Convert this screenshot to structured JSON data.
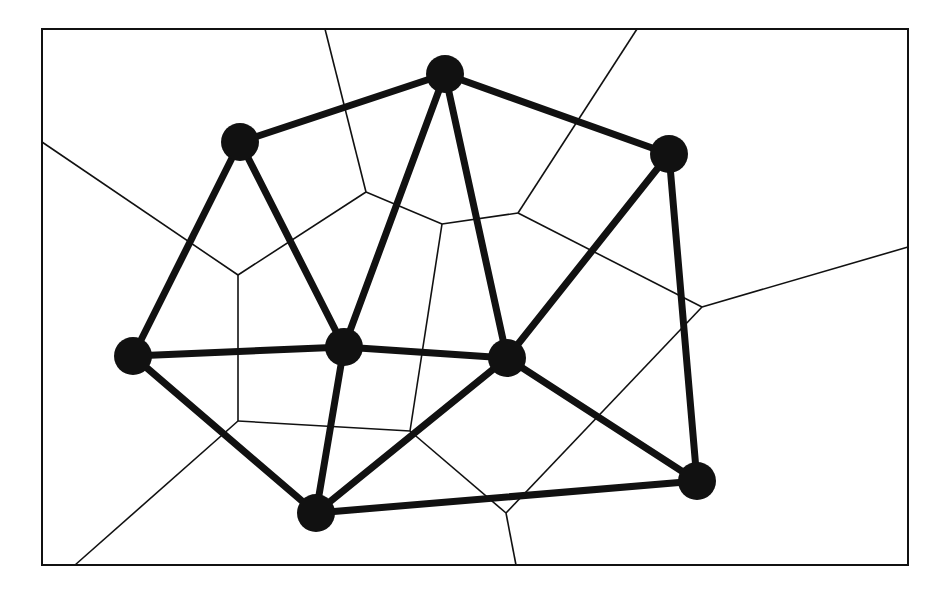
{
  "colors": {
    "background": "#ffffff",
    "ink": "#111111"
  },
  "frame": {
    "x": 42,
    "y": 29,
    "width": 866,
    "height": 536
  },
  "nodes": [
    {
      "id": "A",
      "x": 240,
      "y": 142
    },
    {
      "id": "B",
      "x": 445,
      "y": 74
    },
    {
      "id": "C",
      "x": 669,
      "y": 154
    },
    {
      "id": "D",
      "x": 133,
      "y": 356
    },
    {
      "id": "E",
      "x": 344,
      "y": 347
    },
    {
      "id": "G",
      "x": 507,
      "y": 358
    },
    {
      "id": "F",
      "x": 316,
      "y": 513
    },
    {
      "id": "H",
      "x": 697,
      "y": 481
    }
  ],
  "delaunay_edges": [
    [
      "A",
      "B"
    ],
    [
      "B",
      "C"
    ],
    [
      "A",
      "D"
    ],
    [
      "A",
      "E"
    ],
    [
      "B",
      "E"
    ],
    [
      "B",
      "G"
    ],
    [
      "C",
      "G"
    ],
    [
      "C",
      "H"
    ],
    [
      "D",
      "E"
    ],
    [
      "E",
      "G"
    ],
    [
      "D",
      "F"
    ],
    [
      "E",
      "F"
    ],
    [
      "G",
      "F"
    ],
    [
      "G",
      "H"
    ],
    [
      "F",
      "H"
    ]
  ],
  "voronoi_edges": [
    [
      [
        325,
        29
      ],
      [
        366,
        192
      ]
    ],
    [
      [
        366,
        192
      ],
      [
        238,
        275
      ]
    ],
    [
      [
        42,
        142
      ],
      [
        238,
        275
      ]
    ],
    [
      [
        366,
        192
      ],
      [
        442,
        224
      ]
    ],
    [
      [
        442,
        224
      ],
      [
        518,
        213
      ]
    ],
    [
      [
        637,
        29
      ],
      [
        518,
        213
      ]
    ],
    [
      [
        518,
        213
      ],
      [
        702,
        307
      ]
    ],
    [
      [
        702,
        307
      ],
      [
        908,
        247
      ]
    ],
    [
      [
        238,
        275
      ],
      [
        238,
        421
      ]
    ],
    [
      [
        238,
        421
      ],
      [
        75,
        565
      ]
    ],
    [
      [
        238,
        421
      ],
      [
        410,
        431
      ]
    ],
    [
      [
        442,
        224
      ],
      [
        410,
        431
      ]
    ],
    [
      [
        410,
        431
      ],
      [
        506,
        513
      ]
    ],
    [
      [
        702,
        307
      ],
      [
        506,
        513
      ]
    ],
    [
      [
        506,
        513
      ],
      [
        516,
        565
      ]
    ]
  ]
}
